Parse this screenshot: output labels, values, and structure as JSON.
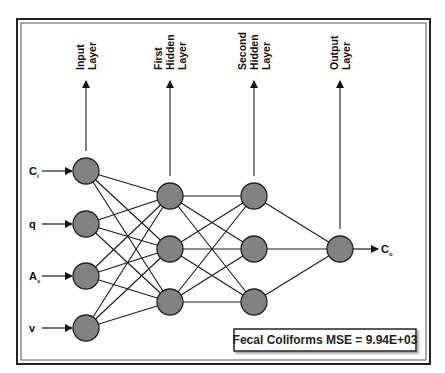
{
  "diagram": {
    "type": "neural-network-architecture",
    "colors": {
      "node_fill": "#828282",
      "node_stroke": "#222222",
      "line": "#1a1a1a",
      "frame": "#333333",
      "background": "#ffffff"
    },
    "layers": [
      {
        "id": "input",
        "label_lines": [
          "Input",
          "Layer"
        ],
        "x": 86,
        "nodes_y": [
          171,
          224,
          276,
          328
        ]
      },
      {
        "id": "hidden1",
        "label_lines": [
          "First",
          "Hidden",
          "Layer"
        ],
        "x": 170,
        "nodes_y": [
          196,
          249,
          302
        ]
      },
      {
        "id": "hidden2",
        "label_lines": [
          "Second",
          "Hidden",
          "Layer"
        ],
        "x": 254,
        "nodes_y": [
          196,
          249,
          302
        ]
      },
      {
        "id": "output",
        "label_lines": [
          "Output",
          "Layer"
        ],
        "x": 340,
        "nodes_y": [
          249
        ]
      }
    ],
    "inputs": [
      {
        "symbol": "C",
        "subscript": "i"
      },
      {
        "symbol": "q",
        "subscript": ""
      },
      {
        "symbol": "A",
        "subscript": "s"
      },
      {
        "symbol": "v",
        "subscript": ""
      }
    ],
    "output": {
      "symbol": "C",
      "subscript": "o"
    },
    "metric_box": {
      "text": "Fecal Coliforms MSE = 9.94E+03"
    }
  }
}
